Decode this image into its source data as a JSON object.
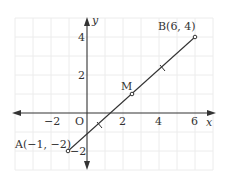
{
  "diagram": {
    "type": "coordinate-plane",
    "grid": {
      "color": "#ececec",
      "x_min": -4,
      "x_max": 7,
      "y_min": -3,
      "y_max": 5
    },
    "axes": {
      "x_label": "x",
      "y_label": "y",
      "origin_label": "O",
      "x_ticks": [
        {
          "value": -2,
          "label": "−2"
        },
        {
          "value": 2,
          "label": "2"
        },
        {
          "value": 4,
          "label": "4"
        },
        {
          "value": 6,
          "label": "6"
        }
      ],
      "y_ticks": [
        {
          "value": 4,
          "label": "4"
        },
        {
          "value": 2,
          "label": "2"
        },
        {
          "value": -2,
          "label": "−2"
        }
      ]
    },
    "points": [
      {
        "name": "A",
        "label": "A(−1, −2)",
        "x": -1,
        "y": -2
      },
      {
        "name": "B",
        "label": "B(6, 4)",
        "x": 6,
        "y": 4
      },
      {
        "name": "M",
        "label": "M",
        "x": 2.5,
        "y": 1
      }
    ],
    "segment": {
      "from": "A",
      "to": "B",
      "equal_tick_marks": 2
    }
  }
}
